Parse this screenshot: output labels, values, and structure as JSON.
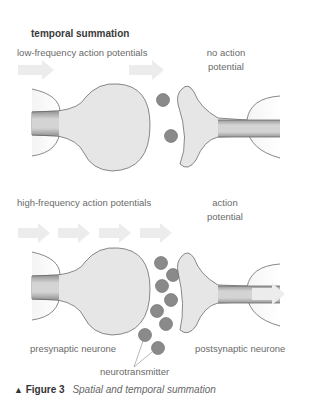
{
  "heading": "temporal summation",
  "top_panel": {
    "input_label": "low-frequency action potentials",
    "output_label_line1": "no action",
    "output_label_line2": "potential",
    "arrows_in": 2,
    "vesicles": 2
  },
  "bottom_panel": {
    "input_label": "high-frequency action potentials",
    "output_label_line1": "action",
    "output_label_line2": "potential",
    "arrows_in": 4,
    "vesicles": 9,
    "presynaptic_label": "presynaptic neurone",
    "postsynaptic_label": "postsynaptic neurone",
    "neurotransmitter_label": "neurotransmitter"
  },
  "caption": {
    "marker": "▲",
    "figure_label": "Figure 3",
    "text": "Spatial and temporal summation"
  },
  "colors": {
    "membrane_fill": "#e6e6e6",
    "outline": "#6b6b6b",
    "vesicle": "#8a8a8a",
    "arrow": "#ececec",
    "axon_core": "#cfcfcf"
  }
}
